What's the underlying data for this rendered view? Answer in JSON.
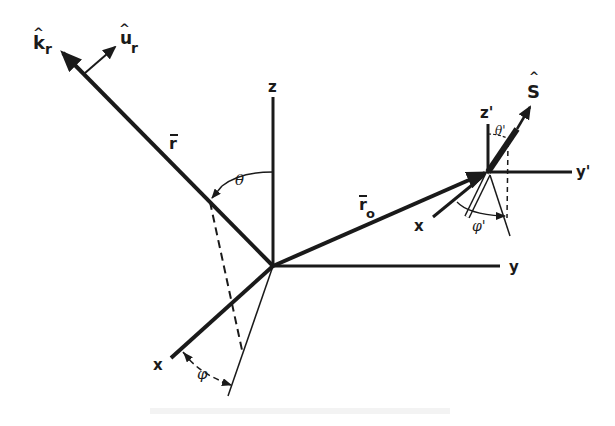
{
  "diagram": {
    "colors": {
      "ink": "#1a1a1a",
      "background": "#ffffff"
    },
    "main_frame": {
      "origin": [
        273,
        266
      ],
      "axes": {
        "z": "z",
        "y": "y",
        "x": "x"
      }
    },
    "vectors": {
      "r": "r",
      "r_bar": "‾",
      "k_r": "k",
      "k_r_sub": "r",
      "u_r": "u",
      "u_r_sub": "r",
      "r_o": "r",
      "r_o_sub": "o",
      "S": "S",
      "hat": "^"
    },
    "angles": {
      "theta": "θ",
      "phi": "φ",
      "theta_prime": "θ'",
      "phi_prime": "φ'"
    },
    "primed_frame": {
      "origin": [
        487,
        172
      ],
      "axes": {
        "z": "z'",
        "y": "y'",
        "x": "x"
      }
    }
  }
}
